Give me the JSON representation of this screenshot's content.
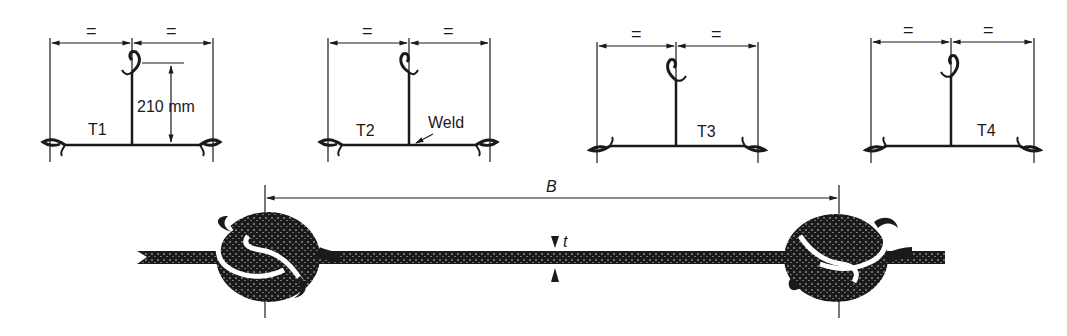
{
  "diagram": {
    "specimens": [
      {
        "id": "T1",
        "label": "T1",
        "dimension_label": "210 mm",
        "equal_marks": [
          "=",
          "="
        ]
      },
      {
        "id": "T2",
        "label": "T2",
        "annotation": "Weld",
        "equal_marks": [
          "=",
          "="
        ]
      },
      {
        "id": "T3",
        "label": "T3",
        "equal_marks": [
          "=",
          "="
        ]
      },
      {
        "id": "T4",
        "label": "T4",
        "equal_marks": [
          "=",
          "="
        ]
      }
    ],
    "cross_section": {
      "width_label": "B",
      "thickness_label": "t"
    },
    "colors": {
      "ink": "#1a1a1a",
      "background": "#ffffff"
    }
  }
}
